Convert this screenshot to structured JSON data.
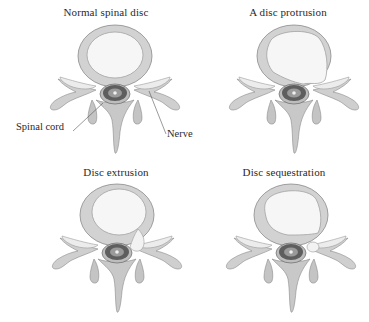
{
  "figure": {
    "style": "grayscale anatomical illustration, axial view of lumbar vertebra",
    "colors": {
      "bone_fill": "#cfcfcf",
      "bone_shade": "#a9a9a9",
      "bone_outline": "#8a8a8a",
      "annulus_fill": "#d6d6d6",
      "nucleus_fill": "#f4f4f4",
      "cord_fill": "#5a5a5a",
      "text": "#2a2a2a"
    },
    "panels": [
      {
        "id": "normal",
        "title": "Normal spinal disc",
        "condition": "normal"
      },
      {
        "id": "protrusion",
        "title": "A disc protrusion",
        "condition": "protrusion"
      },
      {
        "id": "extrusion",
        "title": "Disc extrusion",
        "condition": "extrusion"
      },
      {
        "id": "sequestration",
        "title": "Disc sequestration",
        "condition": "sequestration"
      }
    ],
    "callouts": [
      {
        "label": "Spinal cord",
        "panel": "normal"
      },
      {
        "label": "Nerve",
        "panel": "normal"
      }
    ]
  }
}
